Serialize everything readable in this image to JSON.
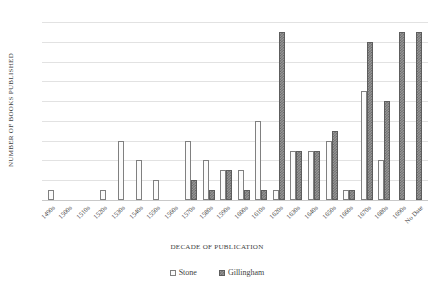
{
  "chart_data": {
    "type": "bar",
    "title": "",
    "xlabel": "DECADE OF PUBLICATION",
    "ylabel": "NUMBER OF BOOKS PUBLISHED",
    "ylim": [
      0,
      18
    ],
    "ytick_step": 2,
    "yticks": [
      0,
      2,
      4,
      6,
      8,
      10,
      12,
      14,
      16,
      18
    ],
    "grid": true,
    "legend_position": "bottom",
    "categories": [
      "1490s",
      "1500s",
      "1510s",
      "1520s",
      "1530s",
      "1540s",
      "1550s",
      "1560s",
      "1570s",
      "1580s",
      "1590s",
      "1600s",
      "1610s",
      "1620s",
      "1630s",
      "1640s",
      "1650s",
      "1660s",
      "1670s",
      "1680s",
      "1690s",
      "No Date"
    ],
    "series": [
      {
        "name": "Stone",
        "color": "#fbfbfb",
        "pattern": "dotted",
        "values": [
          1,
          0,
          0,
          1,
          6,
          4,
          2,
          0,
          6,
          4,
          3,
          3,
          8,
          1,
          5,
          5,
          6,
          1,
          11,
          4,
          0,
          0
        ]
      },
      {
        "name": "Gillingham",
        "color": "#9a9a9a",
        "pattern": "checker",
        "values": [
          0,
          0,
          0,
          0,
          0,
          0,
          0,
          0,
          2,
          1,
          3,
          1,
          1,
          17,
          5,
          5,
          7,
          1,
          16,
          10,
          17,
          17
        ]
      }
    ],
    "tail_note": {
      "last_groups": [
        {
          "category": "1690s",
          "stone": 0,
          "gillingham": 2
        },
        {
          "category": "No Date",
          "stone": 1,
          "gillingham": 1
        }
      ]
    }
  },
  "legend": {
    "items": [
      {
        "label": "Stone"
      },
      {
        "label": "Gillingham"
      }
    ]
  }
}
